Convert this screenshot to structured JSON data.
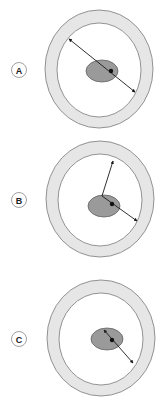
{
  "panels": [
    {
      "label": "A",
      "desc": "line spanning wall-to-wall through nucleus"
    },
    {
      "label": "B",
      "desc": "lines from a point near nucleus edge to inner wall"
    },
    {
      "label": "C",
      "desc": "line across nucleus to inner wall"
    }
  ],
  "colors": {
    "wall_fill": "#e6e6e6",
    "wall_stroke": "#7a7a7a",
    "lumen_fill": "#ffffff",
    "nucleus_fill": "#9a9a9a",
    "nucleus_stroke": "#555555",
    "line": "#1a1a1a"
  }
}
